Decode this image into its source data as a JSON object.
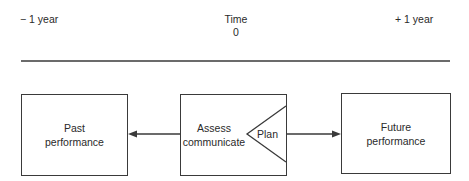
{
  "timeline": {
    "left_label": "− 1 year",
    "center_title": "Time",
    "center_value": "0",
    "right_label": "+ 1 year"
  },
  "boxes": {
    "past": {
      "line1": "Past",
      "line2": "performance"
    },
    "assess": {
      "line1": "Assess",
      "line2": "communicate",
      "plan": "Plan"
    },
    "future": {
      "line1": "Future",
      "line2": "performance"
    }
  },
  "colors": {
    "stroke": "#3a3a3a",
    "text": "#2a2a2a",
    "background": "#ffffff"
  }
}
